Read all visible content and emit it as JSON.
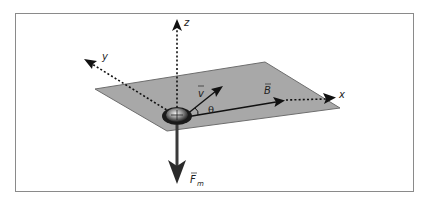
{
  "diagram": {
    "axes": {
      "x_label": "x",
      "y_label": "y",
      "z_label": "z"
    },
    "vectors": {
      "velocity_label": "v",
      "field_label": "B",
      "force_label": "F",
      "force_subscript": "m"
    },
    "angle_label": "θ",
    "charge_symbol": "+",
    "colors": {
      "plane_fill": "#a8a8a8",
      "plane_stroke": "#6e6e6e",
      "frame": "#8a8a8a",
      "arrow": "#1a1a1a",
      "force_arrow": "#3a3a3a"
    }
  }
}
